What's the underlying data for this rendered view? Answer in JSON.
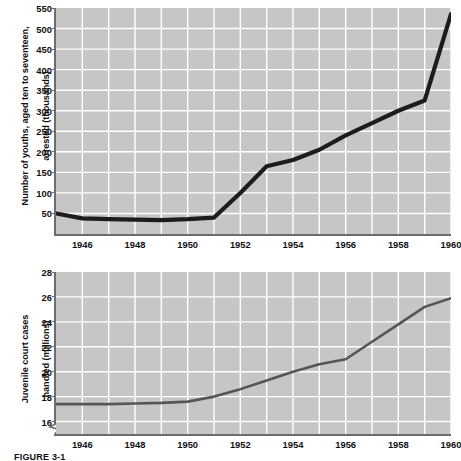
{
  "figure": {
    "caption": "FIGURE 3-1"
  },
  "chart_data": [
    {
      "id": "arrests",
      "type": "line",
      "title": "",
      "xlabel": "",
      "ylabel": "Number of youths, aged ten to seventeen,\narrested (thousands)",
      "ylabel_line1": "Number of youths, aged ten to seventeen,",
      "ylabel_line2": "arrested (thousands)",
      "xlim": [
        1945,
        1960
      ],
      "ylim": [
        0,
        550
      ],
      "ytick_step": 50,
      "xtick_step": 1,
      "grid": true,
      "legend": "none",
      "yticks": [
        50,
        100,
        150,
        200,
        250,
        300,
        350,
        400,
        450,
        500,
        550
      ],
      "xticks": [
        1946,
        1948,
        1950,
        1952,
        1954,
        1956,
        1958,
        1960
      ],
      "x": [
        1945,
        1946,
        1947,
        1948,
        1949,
        1950,
        1951,
        1952,
        1953,
        1954,
        1955,
        1956,
        1957,
        1958,
        1959,
        1960
      ],
      "values": [
        50,
        38,
        36,
        35,
        34,
        36,
        40,
        100,
        165,
        180,
        205,
        240,
        270,
        300,
        325,
        535
      ],
      "series_name": "Youth arrests",
      "line_color": "#1c1c1c",
      "plot_bg": "#c6c6c6",
      "grid_color": "#ffffff"
    },
    {
      "id": "court-cases",
      "type": "line",
      "title": "",
      "xlabel": "",
      "ylabel": "Juvenile court cases\nhandled (millions)",
      "ylabel_line1": "Juvenile court cases",
      "ylabel_line2": "handled (millions)",
      "xlim": [
        1945,
        1960
      ],
      "ylim": [
        15,
        28
      ],
      "ytick_step": 2,
      "xtick_step": 1,
      "grid": true,
      "axis_break": true,
      "legend": "none",
      "yticks": [
        16,
        18,
        20,
        22,
        24,
        26,
        28
      ],
      "xticks": [
        1946,
        1948,
        1950,
        1952,
        1954,
        1956,
        1958,
        1960
      ],
      "x": [
        1945,
        1946,
        1947,
        1948,
        1949,
        1950,
        1951,
        1952,
        1953,
        1954,
        1955,
        1956,
        1957,
        1958,
        1959,
        1960
      ],
      "values": [
        17.4,
        17.4,
        17.4,
        17.45,
        17.5,
        17.6,
        18.0,
        18.6,
        19.3,
        20.0,
        20.6,
        21.0,
        22.4,
        23.8,
        25.2,
        25.9
      ],
      "series_name": "Juvenile court cases",
      "line_color": "#555555",
      "plot_bg": "#c6c6c6",
      "grid_color": "#ffffff"
    }
  ]
}
